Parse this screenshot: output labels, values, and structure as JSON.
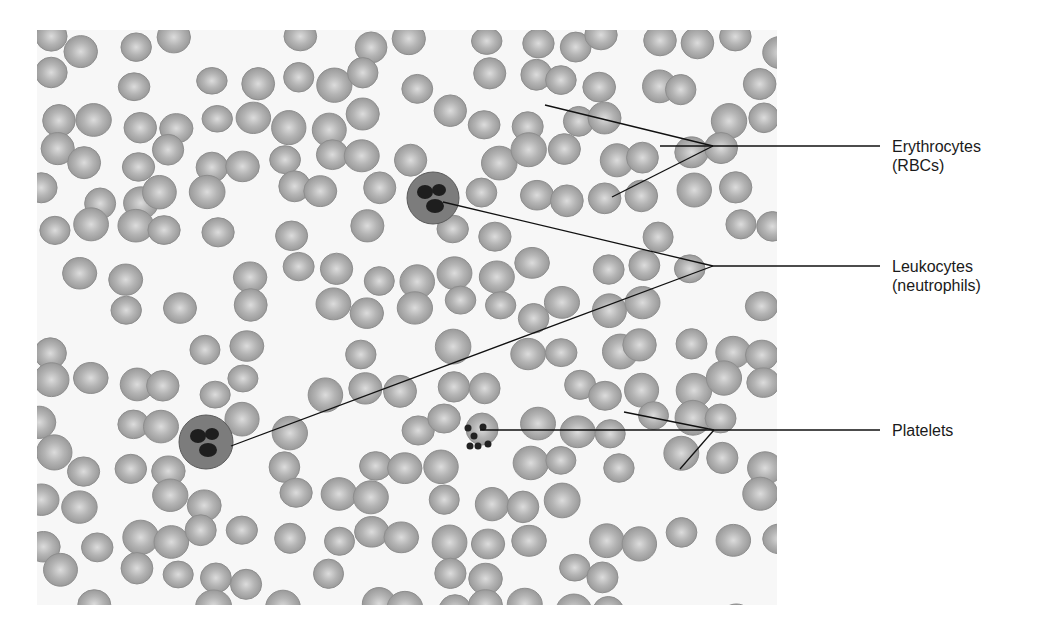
{
  "figure": {
    "labels": [
      {
        "id": "erythrocytes",
        "line1": "Erythrocytes",
        "line2": "(RBCs)",
        "x": 892,
        "y": 138,
        "vertex": [
          713,
          146
        ],
        "targets": [
          [
            545,
            105
          ],
          [
            660,
            146
          ],
          [
            612,
            197
          ]
        ]
      },
      {
        "id": "leukocytes",
        "line1": "Leukocytes",
        "line2": "(neutrophils)",
        "x": 892,
        "y": 258,
        "vertex": [
          713,
          266
        ],
        "targets": [
          [
            443,
            202
          ],
          [
            231,
            446
          ]
        ]
      },
      {
        "id": "platelets",
        "line1": "Platelets",
        "line2": "",
        "x": 892,
        "y": 422,
        "vertex": [
          714,
          430
        ],
        "targets": [
          [
            480,
            430
          ],
          [
            624,
            412
          ],
          [
            680,
            469
          ]
        ]
      }
    ],
    "leader_line_end_x": 880,
    "colors": {
      "rbc_fill": "#9a9a9a",
      "rbc_center": "#dcdcdc",
      "nucleus": "#1e1e1e",
      "line": "#111111",
      "text": "#1a1a1a"
    }
  }
}
